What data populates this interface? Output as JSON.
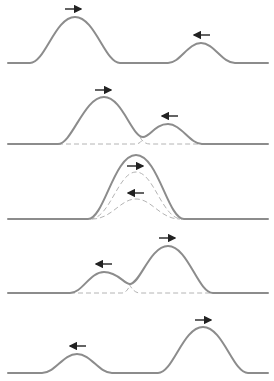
{
  "diagram": {
    "colors": {
      "curve": "#8c8c8c",
      "dashed": "#b4b4b4",
      "arrow": "#222222",
      "background": "#ffffff"
    },
    "panels": [
      {
        "id": 1,
        "stage": "before-overlap",
        "baseline_y": 63,
        "pulses": [
          {
            "role": "large",
            "center_x": 75,
            "peak_y": 17,
            "half_width": 44,
            "direction": "right"
          },
          {
            "role": "small",
            "center_x": 201,
            "peak_y": 43,
            "half_width": 33,
            "direction": "left"
          }
        ],
        "dashed_components": false
      },
      {
        "id": 2,
        "stage": "partial-overlap",
        "baseline_y": 144,
        "pulses": [
          {
            "role": "large",
            "center_x": 104,
            "peak_y": 97,
            "direction": "right"
          },
          {
            "role": "small",
            "center_x": 168,
            "peak_y": 124,
            "direction": "left"
          }
        ],
        "dashed_components": true
      },
      {
        "id": 3,
        "stage": "full-overlap",
        "baseline_y": 219,
        "pulses": [
          {
            "role": "sum",
            "center_x": 136,
            "peak_y": 155
          },
          {
            "role": "large-component",
            "center_x": 136,
            "peak_y": 172,
            "direction": "right"
          },
          {
            "role": "small-component",
            "center_x": 136,
            "peak_y": 199,
            "direction": "left"
          }
        ],
        "dashed_components": true
      },
      {
        "id": 4,
        "stage": "separating",
        "baseline_y": 293,
        "pulses": [
          {
            "role": "small",
            "center_x": 104,
            "peak_y": 272,
            "direction": "left"
          },
          {
            "role": "large",
            "center_x": 168,
            "peak_y": 246,
            "direction": "right"
          }
        ],
        "dashed_components": true
      },
      {
        "id": 5,
        "stage": "after-overlap",
        "baseline_y": 373,
        "pulses": [
          {
            "role": "small",
            "center_x": 77,
            "peak_y": 354,
            "direction": "left"
          },
          {
            "role": "large",
            "center_x": 203,
            "peak_y": 327,
            "direction": "right"
          }
        ],
        "dashed_components": false
      }
    ]
  }
}
